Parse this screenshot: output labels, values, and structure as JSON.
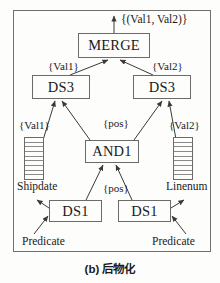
{
  "figure": {
    "caption": "(b) 后物化",
    "border_color": "#6f6f6f",
    "node_border_color": "#6b6b6b",
    "text_color": "#1a1a1a",
    "background": "#fdfdfc"
  },
  "nodes": {
    "merge": "MERGE",
    "ds3_left": "DS3",
    "ds3_right": "DS3",
    "and1": "AND1",
    "ds1_left": "DS1",
    "ds1_right": "DS1"
  },
  "ladders": {
    "shipdate": {
      "label": "Shipdate",
      "rungs": 9
    },
    "linenum": {
      "label": "Linenum",
      "rungs": 9
    }
  },
  "edge_labels": {
    "output_top": "{(Val1, Val2)}",
    "val1_top": "{Val1}",
    "val2_top": "{Val2}",
    "val1_mid": "{Val1}",
    "val2_mid": "{Val2}",
    "pos_upper": "{pos}",
    "pos_lower": "{pos}"
  },
  "inputs": {
    "predicate_left": "Predicate",
    "predicate_right": "Predicate"
  }
}
